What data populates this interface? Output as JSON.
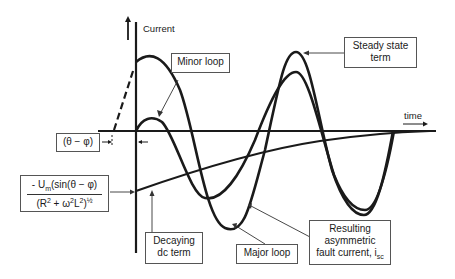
{
  "axes": {
    "y_label": "Current",
    "x_label": "time"
  },
  "annotations": {
    "minor_loop": "Minor loop",
    "steady_state_line1": "Steady state",
    "steady_state_line2": "term",
    "phase_angle": "(θ − φ)",
    "dc_offset_numerator_prefix": "- U",
    "dc_offset_numerator_sub": "m",
    "dc_offset_numerator_rest": "(sin(θ − φ)",
    "dc_offset_denominator_a": "(R",
    "dc_offset_denominator_sup1": "2",
    "dc_offset_denominator_b": " + ω",
    "dc_offset_denominator_sup2": "2",
    "dc_offset_denominator_c": "L",
    "dc_offset_denominator_sup3": "2",
    "dc_offset_denominator_d": ")",
    "dc_offset_denominator_sup4": "½",
    "decaying_line1": "Decaying",
    "decaying_line2": "dc term",
    "major_loop": "Major loop",
    "resulting_line1": "Resulting",
    "resulting_line2": "asymmetric",
    "resulting_line3_prefix": "fault current, i",
    "resulting_line3_sub": "sc"
  },
  "colors": {
    "curve": "#1a1a1a",
    "box_border": "#555555",
    "background": "#ffffff"
  }
}
